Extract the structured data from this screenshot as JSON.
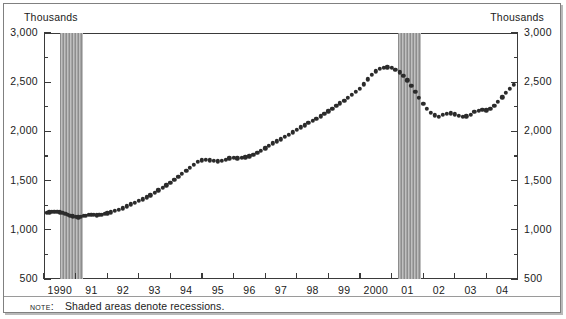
{
  "axis_unit_label_left": "Thousands",
  "axis_unit_label_right": "Thousands",
  "note": {
    "keyword": "Note:",
    "text": "Shaded areas denote recessions."
  },
  "colors": {
    "marker": "#2b2b2b",
    "axis": "#3a3a3a",
    "recession_band": "#a6a6a6",
    "frame": "#808080",
    "background": "#ffffff"
  },
  "chart_data": {
    "type": "scatter",
    "title": "",
    "subtitle": "",
    "xlabel": "",
    "ylabel": "Thousands",
    "y2label": "Thousands",
    "grid": false,
    "legend": null,
    "ylim": [
      500,
      3000
    ],
    "ytick_labels": [
      "500",
      "1,000",
      "1,500",
      "2,000",
      "2,500",
      "3,000"
    ],
    "ytick_values": [
      500,
      1000,
      1500,
      2000,
      2500,
      3000
    ],
    "yminor_values": [
      750,
      1250,
      1750,
      2250,
      2750
    ],
    "xlim": [
      1990.0,
      2005.0
    ],
    "xtick_values": [
      1990,
      1991,
      1992,
      1993,
      1994,
      1995,
      1996,
      1997,
      1998,
      1999,
      2000,
      2001,
      2002,
      2003,
      2004
    ],
    "xtick_labels": [
      "1990",
      "91",
      "92",
      "93",
      "94",
      "95",
      "96",
      "97",
      "98",
      "99",
      "2000",
      "01",
      "02",
      "03",
      "04"
    ],
    "annotations": [
      {
        "label": "Shaded areas denote recessions.",
        "kind": "note"
      }
    ],
    "shaded_regions": [
      {
        "label": "recession",
        "x_start": 1990.5,
        "x_end": 1991.25
      },
      {
        "label": "recession",
        "x_start": 2001.2,
        "x_end": 2001.92
      }
    ],
    "series": [
      {
        "name": "value",
        "marker": "circle",
        "x": [
          1990.08,
          1990.17,
          1990.25,
          1990.33,
          1990.42,
          1990.5,
          1990.58,
          1990.67,
          1990.75,
          1990.83,
          1990.92,
          1991.0,
          1991.08,
          1991.17,
          1991.25,
          1991.33,
          1991.42,
          1991.5,
          1991.58,
          1991.67,
          1991.75,
          1991.83,
          1991.92,
          1992.0,
          1992.12,
          1992.25,
          1992.37,
          1992.5,
          1992.62,
          1992.75,
          1992.87,
          1993.0,
          1993.12,
          1993.25,
          1993.37,
          1993.5,
          1993.62,
          1993.75,
          1993.87,
          1994.0,
          1994.12,
          1994.25,
          1994.37,
          1994.5,
          1994.62,
          1994.75,
          1994.87,
          1995.0,
          1995.12,
          1995.25,
          1995.37,
          1995.5,
          1995.62,
          1995.75,
          1995.87,
          1996.0,
          1996.12,
          1996.25,
          1996.37,
          1996.5,
          1996.62,
          1996.75,
          1996.87,
          1997.0,
          1997.12,
          1997.25,
          1997.37,
          1997.5,
          1997.62,
          1997.75,
          1997.87,
          1998.0,
          1998.12,
          1998.25,
          1998.37,
          1998.5,
          1998.62,
          1998.75,
          1998.87,
          1999.0,
          1999.12,
          1999.25,
          1999.37,
          1999.5,
          1999.62,
          1999.75,
          1999.87,
          2000.0,
          2000.12,
          2000.25,
          2000.37,
          2000.5,
          2000.62,
          2000.75,
          2000.87,
          2001.0,
          2001.12,
          2001.25,
          2001.37,
          2001.5,
          2001.62,
          2001.75,
          2001.87,
          2002.0,
          2002.12,
          2002.25,
          2002.37,
          2002.5,
          2002.62,
          2002.75,
          2002.87,
          2003.0,
          2003.12,
          2003.25,
          2003.37,
          2003.5,
          2003.62,
          2003.75,
          2003.87,
          2004.0,
          2004.12,
          2004.25,
          2004.37,
          2004.5,
          2004.62,
          2004.75,
          2004.87
        ],
        "y": [
          1170,
          1178,
          1180,
          1182,
          1180,
          1176,
          1172,
          1165,
          1155,
          1145,
          1138,
          1130,
          1128,
          1132,
          1140,
          1145,
          1150,
          1152,
          1150,
          1148,
          1150,
          1155,
          1160,
          1168,
          1178,
          1190,
          1205,
          1220,
          1240,
          1258,
          1275,
          1292,
          1310,
          1330,
          1352,
          1375,
          1400,
          1425,
          1452,
          1480,
          1510,
          1540,
          1570,
          1600,
          1630,
          1660,
          1690,
          1705,
          1712,
          1708,
          1700,
          1695,
          1700,
          1712,
          1725,
          1730,
          1728,
          1730,
          1735,
          1745,
          1760,
          1780,
          1805,
          1830,
          1855,
          1878,
          1900,
          1920,
          1942,
          1965,
          1990,
          2015,
          2040,
          2062,
          2085,
          2105,
          2130,
          2155,
          2180,
          2205,
          2230,
          2258,
          2285,
          2312,
          2340,
          2370,
          2400,
          2430,
          2480,
          2530,
          2578,
          2610,
          2635,
          2648,
          2650,
          2645,
          2628,
          2600,
          2565,
          2520,
          2465,
          2405,
          2340,
          2280,
          2228,
          2190,
          2162,
          2150,
          2168,
          2178,
          2182,
          2172,
          2160,
          2150,
          2155,
          2170,
          2198,
          2208,
          2218,
          2215,
          2230,
          2262,
          2300,
          2345,
          2390,
          2430,
          2475
        ]
      }
    ]
  }
}
